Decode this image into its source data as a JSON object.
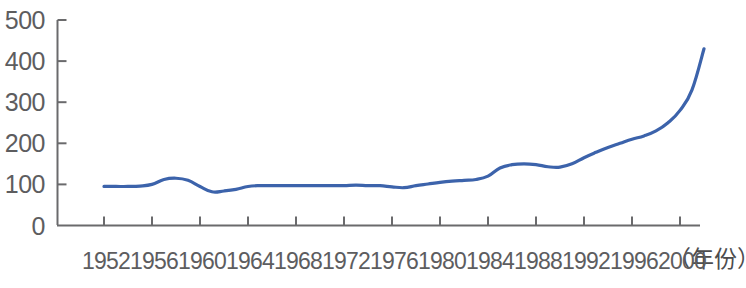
{
  "chart_data": {
    "type": "line",
    "title": "",
    "subtitle": "",
    "xlabel": "（年份）",
    "ylabel": "",
    "grid": false,
    "legend": false,
    "legend_position": "none",
    "line_color": "#3c63ab",
    "axis_color": "#6a6a6c",
    "text_color": "#5d5d5f",
    "xlim": [
      1952,
      2002
    ],
    "ylim": [
      0,
      500
    ],
    "y_ticks": [
      500,
      400,
      300,
      200,
      100,
      0
    ],
    "y_tick_labels": [
      "500",
      "400",
      "300",
      "200",
      "100",
      "0"
    ],
    "x_ticks": [
      1952,
      1956,
      1960,
      1964,
      1968,
      1972,
      1976,
      1980,
      1984,
      1988,
      1992,
      1996,
      2000
    ],
    "x_tick_labels": [
      "1952",
      "1956",
      "1960",
      "1964",
      "1968",
      "1972",
      "1976",
      "1980",
      "1984",
      "1988",
      "1992",
      "1996",
      "2000"
    ],
    "x": [
      1952,
      1953,
      1954,
      1955,
      1956,
      1957,
      1958,
      1959,
      1960,
      1961,
      1962,
      1963,
      1964,
      1965,
      1966,
      1967,
      1968,
      1969,
      1970,
      1971,
      1972,
      1973,
      1974,
      1975,
      1976,
      1977,
      1978,
      1979,
      1980,
      1981,
      1982,
      1983,
      1984,
      1985,
      1986,
      1987,
      1988,
      1989,
      1990,
      1991,
      1992,
      1993,
      1994,
      1995,
      1996,
      1997,
      1998,
      1999,
      2000,
      2001,
      2002
    ],
    "values": [
      95,
      95,
      95,
      96,
      100,
      112,
      115,
      110,
      95,
      82,
      84,
      88,
      95,
      97,
      97,
      97,
      97,
      97,
      97,
      97,
      97,
      98,
      97,
      97,
      94,
      92,
      97,
      101,
      105,
      108,
      110,
      112,
      120,
      140,
      148,
      150,
      148,
      143,
      142,
      150,
      165,
      178,
      190,
      200,
      210,
      218,
      230,
      250,
      280,
      330,
      430
    ],
    "series": [
      {
        "name": "series-1",
        "color": "#3c63ab",
        "values": [
          95,
          95,
          95,
          96,
          100,
          112,
          115,
          110,
          95,
          82,
          84,
          88,
          95,
          97,
          97,
          97,
          97,
          97,
          97,
          97,
          97,
          98,
          97,
          97,
          94,
          92,
          97,
          101,
          105,
          108,
          110,
          112,
          120,
          140,
          148,
          150,
          148,
          143,
          142,
          150,
          165,
          178,
          190,
          200,
          210,
          218,
          230,
          250,
          280,
          330,
          430
        ]
      }
    ]
  }
}
